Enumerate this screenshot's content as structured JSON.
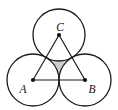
{
  "figure": {
    "labels": {
      "a": "A",
      "b": "B",
      "c": "C"
    },
    "colors": {
      "shade": "#cdcdcd",
      "stroke": "#1c1c1c",
      "background": "#ffffff"
    }
  }
}
